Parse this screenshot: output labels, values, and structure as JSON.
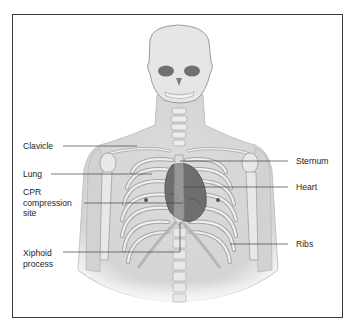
{
  "figure": {
    "frame_color": "#3a3a3a",
    "colors": {
      "body": "#d9d9d9",
      "bone": "#eeeeee",
      "bone_outline": "#9a9a9a",
      "heart": "#6f6f6f",
      "leader": "#444444"
    }
  },
  "labels": {
    "left": [
      {
        "id": "clavicle",
        "lines": [
          "Clavicle"
        ]
      },
      {
        "id": "lung",
        "lines": [
          "Lung"
        ]
      },
      {
        "id": "cpr",
        "lines": [
          "CPR",
          "compression",
          "site"
        ]
      },
      {
        "id": "xiphoid",
        "lines": [
          "Xiphoid",
          "process"
        ]
      }
    ],
    "right": [
      {
        "id": "sternum",
        "lines": [
          "Sternum"
        ]
      },
      {
        "id": "heart",
        "lines": [
          "Heart"
        ]
      },
      {
        "id": "ribs",
        "lines": [
          "Ribs"
        ]
      }
    ]
  }
}
